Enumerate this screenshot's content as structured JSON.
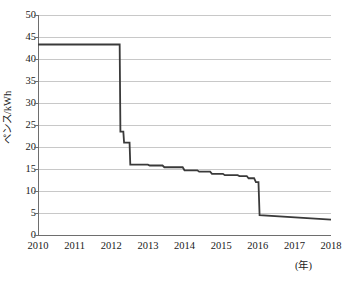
{
  "chart_data": {
    "type": "line",
    "title": "",
    "subtitle": "",
    "xlabel": "(年)",
    "ylabel": "ペンス/kWh",
    "xlim": [
      2010,
      2018
    ],
    "ylim": [
      0,
      50
    ],
    "y_ticks": [
      0,
      5,
      10,
      15,
      20,
      25,
      30,
      35,
      40,
      45,
      50
    ],
    "x_ticks": [
      2010,
      2011,
      2012,
      2013,
      2014,
      2015,
      2016,
      2017,
      2018
    ],
    "x_tick_labels": [
      "2010",
      "2011",
      "2012",
      "2013",
      "2014",
      "2015",
      "2016",
      "2017",
      "2018"
    ],
    "y_tick_labels": [
      "0",
      "5",
      "10",
      "15",
      "20",
      "25",
      "30",
      "35",
      "40",
      "45",
      "50"
    ],
    "grid": "horizontal",
    "legend": "none",
    "series": [
      {
        "name": "ペンス/kWh",
        "color": "#3a3a3a",
        "line_width": 1.8,
        "style": "step",
        "points": [
          [
            2010.0,
            43.3
          ],
          [
            2012.23,
            43.3
          ],
          [
            2012.25,
            23.5
          ],
          [
            2012.33,
            23.5
          ],
          [
            2012.35,
            21.0
          ],
          [
            2012.5,
            21.0
          ],
          [
            2012.52,
            16.0
          ],
          [
            2013.0,
            16.0
          ],
          [
            2013.05,
            15.8
          ],
          [
            2013.4,
            15.8
          ],
          [
            2013.45,
            15.4
          ],
          [
            2013.95,
            15.4
          ],
          [
            2014.0,
            14.7
          ],
          [
            2014.35,
            14.7
          ],
          [
            2014.4,
            14.4
          ],
          [
            2014.7,
            14.4
          ],
          [
            2014.75,
            13.9
          ],
          [
            2015.05,
            13.9
          ],
          [
            2015.1,
            13.6
          ],
          [
            2015.45,
            13.6
          ],
          [
            2015.5,
            13.4
          ],
          [
            2015.7,
            13.4
          ],
          [
            2015.75,
            12.9
          ],
          [
            2015.9,
            12.9
          ],
          [
            2015.95,
            12.0
          ],
          [
            2016.02,
            12.0
          ],
          [
            2016.05,
            4.5
          ],
          [
            2018.0,
            3.5
          ]
        ]
      }
    ],
    "annotations": [
      {
        "text": "2012年の大幅下落",
        "visible": false
      }
    ]
  },
  "axis_style": {
    "grid_color": "#c8c8c8",
    "axis_color": "#6e6e6e",
    "line_color": "#3a3a3a",
    "background": "#ffffff"
  }
}
